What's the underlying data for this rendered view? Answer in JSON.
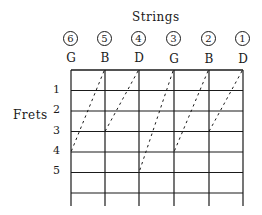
{
  "diagram": {
    "title": "Strings",
    "axis_label": "Frets",
    "strings": [
      {
        "number": "6",
        "note": "G"
      },
      {
        "number": "5",
        "note": "B"
      },
      {
        "number": "4",
        "note": "D"
      },
      {
        "number": "3",
        "note": "G"
      },
      {
        "number": "2",
        "note": "B"
      },
      {
        "number": "1",
        "note": "D"
      }
    ],
    "fret_numbers": [
      "1",
      "2",
      "3",
      "4",
      "5"
    ],
    "tuning_connections": [
      {
        "from_string": "5",
        "from_fret": "0",
        "to_string": "6",
        "to_fret": "4"
      },
      {
        "from_string": "4",
        "from_fret": "0",
        "to_string": "5",
        "to_fret": "3"
      },
      {
        "from_string": "3",
        "from_fret": "0",
        "to_string": "4",
        "to_fret": "5"
      },
      {
        "from_string": "2",
        "from_fret": "0",
        "to_string": "3",
        "to_fret": "4"
      },
      {
        "from_string": "1",
        "from_fret": "0",
        "to_string": "2",
        "to_fret": "3"
      }
    ],
    "colors": {
      "ink": "#1a1a1a",
      "background": "#ffffff"
    }
  }
}
